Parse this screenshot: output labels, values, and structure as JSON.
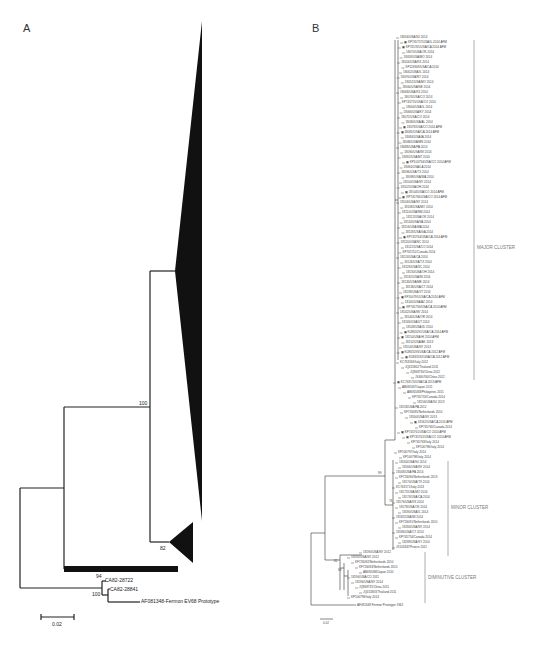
{
  "panels": {
    "A": {
      "label": "A",
      "bootstrap": {
        "n100_top": "100",
        "n82": "82",
        "n94": "94",
        "n100_bottom": "100"
      },
      "tips": {
        "ca82_28722": "CA82-28722",
        "ca82_28841": "CA82-28841",
        "fermon": "AF081348-Fermon EV68 Prototype"
      },
      "scale_bar": "0.02"
    },
    "B": {
      "label": "B",
      "clusters": {
        "major": "MAJOR CLUSTER",
        "minor": "MINOR CLUSTER",
        "diminutive": "DIMINUTIVE CLUSTER"
      },
      "outgroup": "AF081348 Fermon Prototype 1962",
      "scale_bar": "0.02",
      "bootstrap": {
        "b1": "99",
        "b2": "76",
        "b3": "82",
        "b4": "94",
        "b5": "100"
      },
      "tips": [
        "18056/USA/NJ 2014",
        "KP745757/USA/IL 2014 AFM",
        "KP745765/USA/CA 2014 AFM",
        "18070/USA/OK 2014",
        "18058/USA/MO 2014",
        "18054/USA/KS 2014",
        "KP126908/USA/CA 2014",
        "18062/USA/IL 2014",
        "18076/USA/NY 2014",
        "18052/USA/MO 2014",
        "18060/USA/NE 2014",
        "18068/USA/KS 2014",
        "18074/USA/CO 2014",
        "KP745755/USA/CO 2014",
        "18064/USA/IL 2014",
        "18066/USA/KY 2014",
        "18072/USA/CO 2014",
        "18080/USA/AL 2014",
        "18078/USA/CO 2014 AFM",
        "18082/USA/CA 2014 AFM",
        "18084/USA/IA 2014",
        "18086/USA/MN 2014",
        "18088/USA/PA 2014",
        "18090/USA/WI 2014",
        "18092/USA/MT 2014",
        "KP100794/USA/CO 2014 AFM",
        "18094/USA/LA 2014",
        "18096/USA/TX 2014",
        "18098/USA/WA 2014",
        "18100/USA/NY 2014",
        "18102/USA/OH 2014",
        "18104/USA/CO 2014 AFM",
        "KP745766/USA/CO 2014 AFM",
        "18106/USA/NY 2014",
        "18108/USA/MO 2014",
        "18110/USA/NM 2014",
        "18112/USA/OK 2014",
        "18114/USA/VA 2014",
        "18116/USA/MA 2014",
        "18118/USA/GA 2014",
        "KP745764/USA/CA 2014 AFM",
        "18120/USA/NC 2014",
        "18122/USA/CO 2014",
        "KP745752/Canada 2014",
        "18124/USA/CA 2014",
        "18126/USA/TX 2014",
        "18128/USA/SC 2014",
        "18130/USA/OH 2014",
        "18132/USA/IN 2014",
        "18134/USA/ME 2014",
        "18136/USA/CT 2014",
        "18138/USA/VT 2014",
        "KP100795/USA/CA 2014 AFM",
        "18140/USA/AZ 2014",
        "KP745759/USA/CA 2014 AFM",
        "18142/USA/NV 2014",
        "18144/USA/OR 2014",
        "18146/USA/UT 2014",
        "18148/USA/ID 2014",
        "KU865591/USA/CA 2014 AFM",
        "18150/USA/HI 2014 AFM",
        "18152/USA/AK 2013",
        "18154/USA/NY 2013",
        "KU865593/USA/CA 2012 AFM",
        "KU865592/USA/CA 2012 AFM",
        "KC763169/Italy 2012",
        "JQ411862/Thailand 2011",
        "JQ868730/China 2012",
        "JX460760/China 2012",
        "KC763170/USA/CA 2013 AFM",
        "AB692467/Japan 2011",
        "AB692483/Philippines 2011",
        "KP745753/Canada 2014",
        "18156/USA/NJ 2013",
        "18158/USA/PA 2012",
        "KF726085/Netherlands 2010",
        "18160/USA/NY 2013",
        "18162/USA/CA 2014 AFM",
        "KP745760/Canada 2014",
        "KP745761/USA/CO 2014 AFM",
        "KP745762/USA/CO 2014 AFM",
        "KP745763/Italy 2014",
        "KP100796/Italy 2014",
        "KP100797/Italy 2014",
        "KP100798/Italy 2014",
        "18164/USA/NJ 2014",
        "18166/USA/NY 2014",
        "18168/USA/PA 2014",
        "KF726090/Netherlands 2013",
        "18170/USA/TX 2014",
        "KC763171/Italy 2013",
        "18172/USA/MO 2014",
        "18174/USA/CA 2014",
        "18176/USA/KS 2014",
        "18178/USA/OK 2014",
        "18180/USA/IL 2014",
        "18182/USA/MI 2014",
        "KF726091/Netherlands 2010",
        "18184/USA/NY 2014",
        "18186/USA/CT 2014",
        "KP745754/Canada 2014",
        "18188/USA/KY 2014",
        "JX101847/France 2011",
        "18190/USA/NY 2012",
        "18192/USA/NY 2012",
        "KF726092/Netherlands 2010",
        "KF726093/Netherlands 2010",
        "AB692468/Japan 2010",
        "18194/USA/CO 2011",
        "18196/USA/NY 2014",
        "JQ868731/China 2011",
        "JQ411863/Thailand 2011",
        "KP100799/Italy 2014"
      ]
    }
  }
}
